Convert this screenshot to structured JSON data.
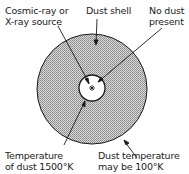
{
  "diagram": {
    "labels": {
      "source_line1": "Cosmic-ray or",
      "source_line2": "X-ray source",
      "shell": "Dust shell",
      "nodust_line1": "No dust",
      "nodust_line2": "present",
      "inner_temp_line1": "Temperature",
      "inner_temp_line2": "of dust 1500°K",
      "outer_temp_line1": "Dust temperature",
      "outer_temp_line2": "may be 100°K"
    },
    "colors": {
      "shell_fill": "#bdbdbd",
      "stroke": "#1a1a1a"
    }
  }
}
